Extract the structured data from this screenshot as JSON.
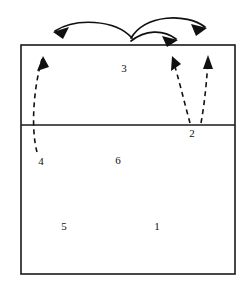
{
  "figure": {
    "type": "court-diagram",
    "background_color": "#ffffff",
    "line_color": "#1a1a1a",
    "label_color": "#111111"
  },
  "court": {
    "outer_rect": {
      "x": 21,
      "y": 45,
      "width": 214,
      "height": 229
    },
    "divider_line": {
      "x1": 21,
      "y1": 125,
      "x2": 235,
      "y2": 125
    },
    "front_zone_label": "front-zone",
    "back_zone_label": "back-zone"
  },
  "zone_labels": [
    {
      "id": "label-3",
      "text": "3",
      "x": 124,
      "y": 68
    },
    {
      "id": "label-2",
      "text": "2",
      "x": 192,
      "y": 133
    },
    {
      "id": "label-4",
      "text": "4",
      "x": 41,
      "y": 161
    },
    {
      "id": "label-6",
      "text": "6",
      "x": 118,
      "y": 160
    },
    {
      "id": "label-5",
      "text": "5",
      "x": 64,
      "y": 226
    },
    {
      "id": "label-1",
      "text": "1",
      "x": 157,
      "y": 226
    }
  ],
  "solid_arrows": [
    {
      "id": "arrow-center-to-left",
      "description": "curved solid arrow from center top arcing left",
      "path": "M 132 38 C 115 19 75 18 55 31",
      "head": "M 55 31 L 67 28 L 62 38 Z"
    },
    {
      "id": "arrow-center-to-far-right",
      "description": "curved solid arrow from center top arcing right and far",
      "path": "M 131 38 C 146 14 186 13 205 27",
      "head": "M 205 27 L 193 25 L 198 35 Z"
    },
    {
      "id": "arrow-center-to-right",
      "description": "curved shorter solid arrow from center arcing right",
      "path": "M 131 41 C 145 30 164 29 176 38",
      "head": "M 176 38 L 164 36 L 168 46 Z"
    }
  ],
  "dashed_arrows": [
    {
      "id": "dashed-arrow-from-4",
      "description": "dashed arrow from zone 4 area upward to left front",
      "path": "M 37 152 C 31 130 33 90 42 58",
      "head": "M 42 58 L 38 70 L 48 67 Z"
    },
    {
      "id": "dashed-arrow-from-2-inner",
      "description": "dashed arrow from near divider at zone 2 upward-left into front zone",
      "path": "M 190 122 C 183 100 178 75 173 58",
      "head": "M 173 58 L 172 70 L 181 65 Z"
    },
    {
      "id": "dashed-arrow-from-2-outer",
      "description": "dashed arrow from near divider right of zone 2 upward to front right",
      "path": "M 201 122 C 205 100 207 75 208 57",
      "head": "M 208 57 L 203 68 L 213 68 Z"
    }
  ]
}
